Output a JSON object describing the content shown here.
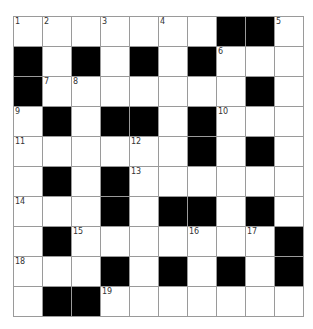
{
  "puzzle": {
    "rows": 10,
    "cols": 10,
    "colors": {
      "block": "#000000",
      "cell": "#ffffff",
      "grid_line": "#9a9a9a",
      "number": "#333333"
    },
    "grid": [
      [
        "1",
        "2",
        ".",
        "3",
        ".",
        "4",
        ".",
        "#",
        "#",
        "5"
      ],
      [
        "#",
        ".",
        "#",
        ".",
        "#",
        ".",
        "#",
        "6",
        ".",
        "."
      ],
      [
        "#",
        "7",
        "8",
        ".",
        ".",
        ".",
        ".",
        ".",
        "#",
        "."
      ],
      [
        "9",
        "#",
        ".",
        "#",
        "#",
        ".",
        "#",
        "10",
        ".",
        "."
      ],
      [
        "11",
        ".",
        ".",
        ".",
        "12",
        ".",
        "#",
        ".",
        "#",
        "."
      ],
      [
        ".",
        "#",
        ".",
        "#",
        "13",
        ".",
        ".",
        ".",
        ".",
        "."
      ],
      [
        "14",
        ".",
        ".",
        "#",
        ".",
        "#",
        "#",
        ".",
        "#",
        "."
      ],
      [
        ".",
        "#",
        "15",
        ".",
        ".",
        ".",
        "16",
        ".",
        "17",
        "#"
      ],
      [
        "18",
        ".",
        ".",
        "#",
        ".",
        "#",
        ".",
        "#",
        ".",
        "#"
      ],
      [
        ".",
        "#",
        "#",
        "19",
        ".",
        ".",
        ".",
        ".",
        ".",
        "."
      ]
    ],
    "legend": {
      "#": "black block",
      ".": "empty white cell",
      "digits": "clue number in empty white cell"
    }
  }
}
